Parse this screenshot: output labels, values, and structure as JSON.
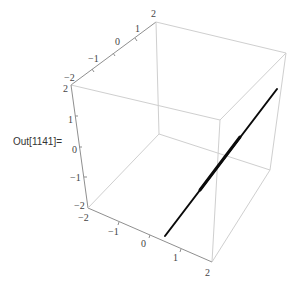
{
  "cell": {
    "output_label": "Out[1141]="
  },
  "plot3d": {
    "type": "3d-line",
    "box": true,
    "colors": {
      "box_edge": "#cfcfcf",
      "axis_edge": "#8f8f8f",
      "curve": "#0a0a0a",
      "background": "#ffffff"
    },
    "axes": {
      "x": {
        "range": [
          -2,
          2
        ],
        "ticks": [
          "−2",
          "−1",
          "0",
          "1",
          "2"
        ]
      },
      "y": {
        "range": [
          -2,
          2
        ],
        "ticks": [
          "−2",
          "−1",
          "0",
          "1",
          "2"
        ]
      },
      "z": {
        "range": [
          -2,
          2
        ],
        "ticks": [
          "2",
          "1",
          "0",
          "−1",
          "−2"
        ]
      }
    },
    "top_axis_ticks": [
      "−2",
      "−1",
      "0",
      "1",
      "2"
    ],
    "left_axis_ticks": [
      "2",
      "1",
      "0",
      "−1",
      "−2"
    ],
    "bottom_axis_ticks": [
      "−2",
      "−1",
      "0",
      "1",
      "2"
    ]
  }
}
